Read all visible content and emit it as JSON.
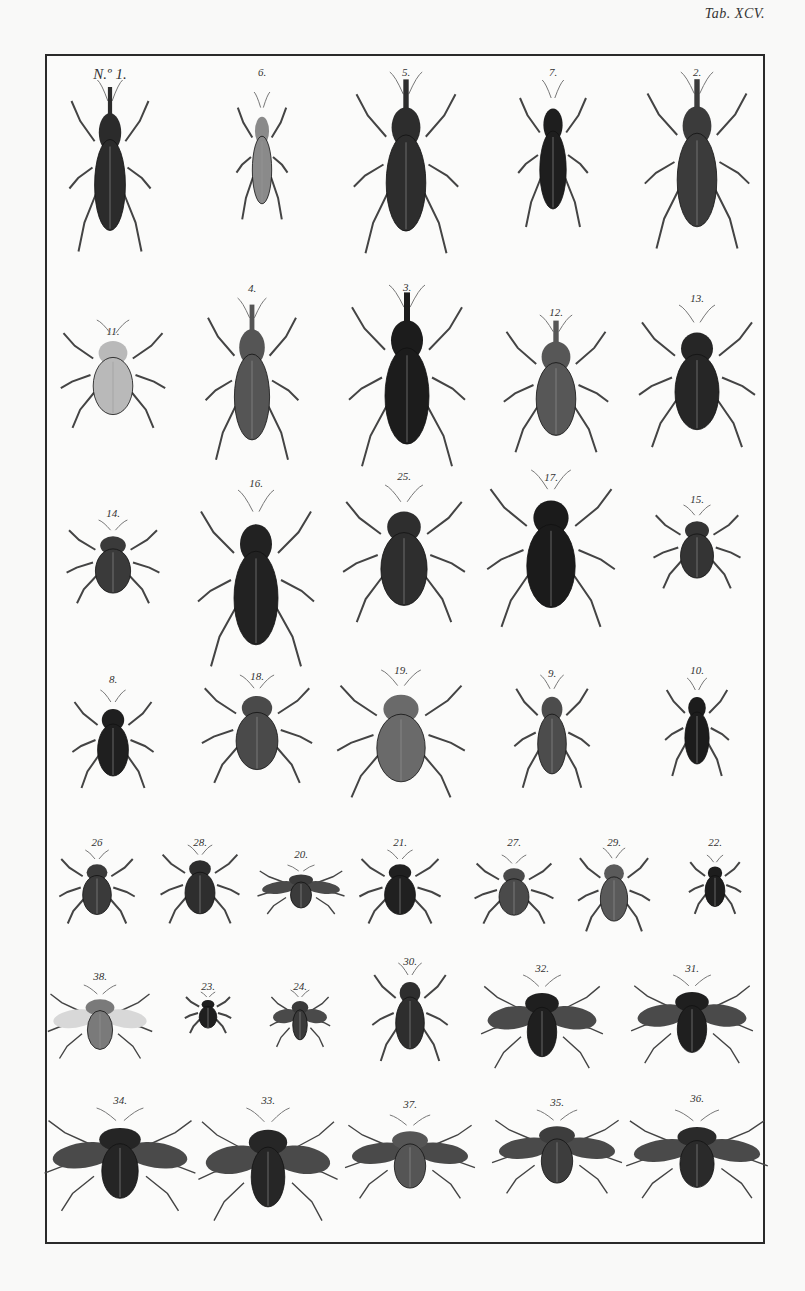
{
  "plate": {
    "title": "Tab. XCV.",
    "description": "Engraved plate of beetles and true bugs, 38 numbered figures arranged in 7 rows",
    "colors": {
      "ink": "#1f1f1f",
      "paper": "#f9f9f8",
      "frame": "#2a2a2a"
    }
  },
  "rows": [
    {
      "specimens": [
        {
          "label": "N.º 1.",
          "kind": "weevil",
          "x": 110,
          "y": 80,
          "w": 70,
          "h": 175,
          "tone": "#2b2b2b"
        },
        {
          "label": "6.",
          "kind": "click-beetle",
          "x": 262,
          "y": 92,
          "w": 44,
          "h": 130,
          "tone": "#8a8a8a"
        },
        {
          "label": "5.",
          "kind": "long-snout-weevil",
          "x": 406,
          "y": 72,
          "w": 90,
          "h": 185,
          "tone": "#2d2d2d"
        },
        {
          "label": "7.",
          "kind": "elongate-beetle",
          "x": 553,
          "y": 80,
          "w": 60,
          "h": 150,
          "tone": "#1e1e1e"
        },
        {
          "label": "2.",
          "kind": "weevil",
          "x": 697,
          "y": 72,
          "w": 90,
          "h": 180,
          "tone": "#3b3b3b"
        }
      ],
      "label_y": [
        66,
        66,
        66,
        66,
        66
      ]
    },
    {
      "specimens": [
        {
          "label": "11.",
          "kind": "spotted-beetle",
          "x": 113,
          "y": 320,
          "w": 90,
          "h": 110,
          "tone": "#b9b9b9"
        },
        {
          "label": "4.",
          "kind": "weevil",
          "x": 252,
          "y": 298,
          "w": 80,
          "h": 165,
          "tone": "#555555"
        },
        {
          "label": "3.",
          "kind": "long-snout-weevil",
          "x": 407,
          "y": 285,
          "w": 100,
          "h": 185,
          "tone": "#1c1c1c"
        },
        {
          "label": "12.",
          "kind": "textured-weevil",
          "x": 556,
          "y": 315,
          "w": 90,
          "h": 140,
          "tone": "#575757"
        },
        {
          "label": "13.",
          "kind": "ground-beetle",
          "x": 697,
          "y": 305,
          "w": 100,
          "h": 145,
          "tone": "#262626"
        }
      ],
      "label_y": [
        325,
        282,
        281,
        306,
        292
      ]
    },
    {
      "specimens": [
        {
          "label": "14.",
          "kind": "spotted-bug",
          "x": 113,
          "y": 520,
          "w": 80,
          "h": 85,
          "tone": "#3a3a3a"
        },
        {
          "label": "16.",
          "kind": "ground-beetle",
          "x": 256,
          "y": 490,
          "w": 100,
          "h": 180,
          "tone": "#222222"
        },
        {
          "label": "25.",
          "kind": "shield-bug",
          "x": 404,
          "y": 485,
          "w": 105,
          "h": 140,
          "tone": "#2e2e2e"
        },
        {
          "label": "17.",
          "kind": "ground-beetle",
          "x": 551,
          "y": 470,
          "w": 110,
          "h": 160,
          "tone": "#1b1b1b"
        },
        {
          "label": "15.",
          "kind": "spotted-bug",
          "x": 697,
          "y": 505,
          "w": 75,
          "h": 85,
          "tone": "#343434"
        }
      ],
      "label_y": [
        507,
        477,
        470,
        471,
        493
      ]
    },
    {
      "specimens": [
        {
          "label": "8.",
          "kind": "click-beetle",
          "x": 113,
          "y": 690,
          "w": 70,
          "h": 100,
          "tone": "#1f1f1f"
        },
        {
          "label": "18.",
          "kind": "speckled-beetle",
          "x": 257,
          "y": 675,
          "w": 95,
          "h": 110,
          "tone": "#4a4a4a"
        },
        {
          "label": "19.",
          "kind": "textured-beetle",
          "x": 401,
          "y": 670,
          "w": 110,
          "h": 130,
          "tone": "#6a6a6a"
        },
        {
          "label": "9.",
          "kind": "elongate-beetle",
          "x": 552,
          "y": 675,
          "w": 65,
          "h": 115,
          "tone": "#4c4c4c"
        },
        {
          "label": "10.",
          "kind": "click-beetle",
          "x": 697,
          "y": 678,
          "w": 55,
          "h": 100,
          "tone": "#1c1c1c"
        }
      ],
      "label_y": [
        673,
        670,
        664,
        667,
        664
      ]
    },
    {
      "specimens": [
        {
          "label": "26",
          "kind": "shield-bug",
          "x": 97,
          "y": 850,
          "w": 65,
          "h": 75,
          "tone": "#3a3a3a"
        },
        {
          "label": "28.",
          "kind": "slender-bug",
          "x": 200,
          "y": 845,
          "w": 68,
          "h": 80,
          "tone": "#2e2e2e"
        },
        {
          "label": "20.",
          "kind": "winged-beetle",
          "x": 301,
          "y": 865,
          "w": 75,
          "h": 50,
          "tone": "#3b3b3b"
        },
        {
          "label": "21.",
          "kind": "ladybird",
          "x": 400,
          "y": 850,
          "w": 70,
          "h": 75,
          "tone": "#202020"
        },
        {
          "label": "27.",
          "kind": "speckled-bug",
          "x": 514,
          "y": 855,
          "w": 68,
          "h": 70,
          "tone": "#4a4a4a"
        },
        {
          "label": "29.",
          "kind": "slender-bug",
          "x": 614,
          "y": 848,
          "w": 62,
          "h": 85,
          "tone": "#5a5a5a"
        },
        {
          "label": "22.",
          "kind": "small-beetle",
          "x": 715,
          "y": 855,
          "w": 45,
          "h": 60,
          "tone": "#1d1d1d"
        }
      ],
      "label_y": [
        836,
        836,
        848,
        836,
        836,
        836,
        836
      ]
    },
    {
      "specimens": [
        {
          "label": "38.",
          "kind": "fly",
          "x": 100,
          "y": 985,
          "w": 90,
          "h": 75,
          "tone": "#7a7a7a"
        },
        {
          "label": "23.",
          "kind": "small-bug",
          "x": 208,
          "y": 992,
          "w": 40,
          "h": 42,
          "tone": "#1f1f1f"
        },
        {
          "label": "24.",
          "kind": "small-fly",
          "x": 300,
          "y": 990,
          "w": 52,
          "h": 58,
          "tone": "#3a3a3a"
        },
        {
          "label": "30.",
          "kind": "slender-bug",
          "x": 410,
          "y": 963,
          "w": 65,
          "h": 100,
          "tone": "#2e2e2e"
        },
        {
          "label": "32.",
          "kind": "winged-bug",
          "x": 542,
          "y": 975,
          "w": 105,
          "h": 95,
          "tone": "#1f1f1f"
        },
        {
          "label": "31.",
          "kind": "winged-bug",
          "x": 692,
          "y": 975,
          "w": 105,
          "h": 90,
          "tone": "#1f1f1f"
        }
      ],
      "label_y": [
        970,
        980,
        980,
        955,
        962,
        962
      ]
    },
    {
      "specimens": [
        {
          "label": "34.",
          "kind": "winged-bug",
          "x": 120,
          "y": 1108,
          "w": 130,
          "h": 105,
          "tone": "#252525"
        },
        {
          "label": "33.",
          "kind": "winged-bug",
          "x": 268,
          "y": 1108,
          "w": 120,
          "h": 115,
          "tone": "#262626"
        },
        {
          "label": "37.",
          "kind": "lantern-bug",
          "x": 410,
          "y": 1115,
          "w": 112,
          "h": 85,
          "tone": "#555555"
        },
        {
          "label": "35.",
          "kind": "lantern-bug",
          "x": 557,
          "y": 1110,
          "w": 112,
          "h": 85,
          "tone": "#3d3d3d"
        },
        {
          "label": "36.",
          "kind": "lantern-bug",
          "x": 697,
          "y": 1110,
          "w": 122,
          "h": 90,
          "tone": "#2a2a2a"
        }
      ],
      "label_y": [
        1094,
        1094,
        1098,
        1096,
        1092
      ]
    }
  ]
}
